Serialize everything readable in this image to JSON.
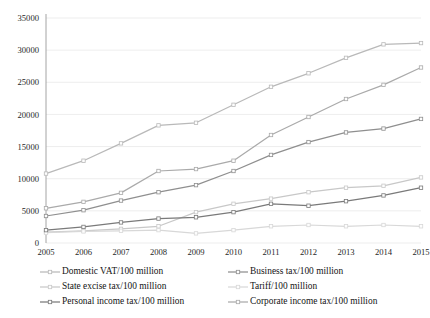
{
  "chart_data": {
    "type": "line",
    "title": "",
    "xlabel": "",
    "ylabel": "",
    "x": [
      "2005",
      "2006",
      "2007",
      "2008",
      "2009",
      "2010",
      "2011",
      "2012",
      "2013",
      "2014",
      "2015"
    ],
    "categories": [
      "2005",
      "2006",
      "2007",
      "2008",
      "2009",
      "2010",
      "2011",
      "2012",
      "2013",
      "2014",
      "2015"
    ],
    "ylim": [
      0,
      35000
    ],
    "yticks": [
      "0",
      "5000",
      "10000",
      "15000",
      "20000",
      "25000",
      "30000",
      "35000"
    ],
    "ytick_values": [
      0,
      5000,
      10000,
      15000,
      20000,
      25000,
      30000,
      35000
    ],
    "grid": true,
    "legend_position": "bottom",
    "series": [
      {
        "name": "Domestic VAT/100 million",
        "color": "#b9b9b9",
        "values": [
          10800,
          12800,
          15500,
          18300,
          18700,
          21500,
          24300,
          26400,
          28800,
          30900,
          31100
        ]
      },
      {
        "name": "Business tax/100 million",
        "color": "#8f8f8f",
        "values": [
          4200,
          5100,
          6600,
          7900,
          9000,
          11200,
          13700,
          15700,
          17200,
          17800,
          19300
        ]
      },
      {
        "name": "State excise tax/100 million",
        "color": "#c8c8c8",
        "values": [
          1700,
          1900,
          2200,
          2600,
          4800,
          6100,
          6900,
          7900,
          8600,
          8900,
          10200
        ]
      },
      {
        "name": "Tariff/100 million",
        "color": "#d8d8d8",
        "values": [
          1600,
          1800,
          1900,
          2000,
          1500,
          2000,
          2600,
          2800,
          2600,
          2800,
          2600
        ]
      },
      {
        "name": "Personal income tax/100 million",
        "color": "#7a7a7a",
        "values": [
          2000,
          2500,
          3200,
          3800,
          4000,
          4800,
          6100,
          5800,
          6500,
          7400,
          8600
        ]
      },
      {
        "name": "Corporate income tax/100 million",
        "color": "#aaaaaa",
        "values": [
          5400,
          6400,
          7800,
          11200,
          11500,
          12800,
          16800,
          19600,
          22400,
          24600,
          27300
        ]
      }
    ],
    "legend": [
      {
        "label": "Domestic VAT/100 million",
        "color": "#b9b9b9",
        "column": 0,
        "row": 0
      },
      {
        "label": "State excise tax/100 million",
        "color": "#c8c8c8",
        "column": 0,
        "row": 1
      },
      {
        "label": "Personal income tax/100 million",
        "color": "#7a7a7a",
        "column": 0,
        "row": 2
      },
      {
        "label": "Business tax/100 million",
        "color": "#8f8f8f",
        "column": 1,
        "row": 0
      },
      {
        "label": "Tariff/100 million",
        "color": "#d8d8d8",
        "column": 1,
        "row": 1
      },
      {
        "label": "Corporate income tax/100 million",
        "color": "#aaaaaa",
        "column": 1,
        "row": 2
      }
    ]
  }
}
